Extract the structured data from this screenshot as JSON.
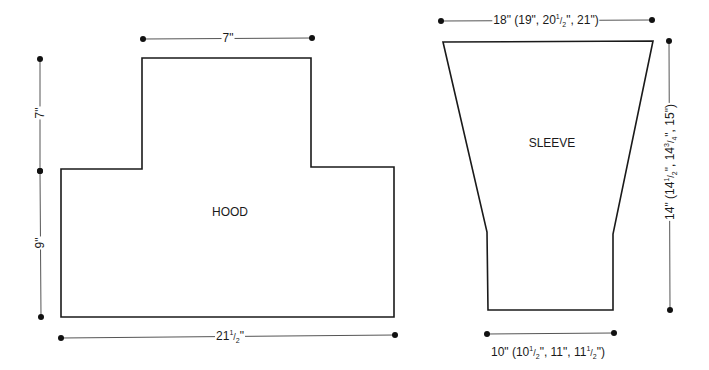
{
  "colors": {
    "background": "#ffffff",
    "outline": "#1a1a1a",
    "dimension_line": "#555555",
    "dot": "#111111",
    "text": "#1a1a1a"
  },
  "hood": {
    "label": "HOOD",
    "label_pos": [
      230,
      212
    ],
    "outline_points": [
      [
        142,
        58
      ],
      [
        311,
        58
      ],
      [
        311,
        167
      ],
      [
        394,
        167
      ],
      [
        394,
        317
      ],
      [
        61,
        317
      ],
      [
        61,
        169
      ],
      [
        142,
        169
      ]
    ],
    "dims": {
      "top_width": {
        "text_main": "7\"",
        "from": [
          143,
          39
        ],
        "to": [
          312,
          38
        ],
        "label_pos": [
          228,
          38
        ],
        "orientation": "horizontal"
      },
      "upper_height": {
        "text_main": "7\"",
        "from": [
          40,
          59
        ],
        "to": [
          40,
          171
        ],
        "label_pos": [
          40,
          113
        ],
        "orientation": "vertical"
      },
      "lower_height": {
        "text_main": "9\"",
        "from": [
          40,
          171
        ],
        "to": [
          41,
          317
        ],
        "label_pos": [
          40,
          243
        ],
        "orientation": "vertical"
      },
      "bottom_width": {
        "text_whole": "21",
        "frac_num": "1",
        "frac_den": "2",
        "text_suffix": "\"",
        "from": [
          61,
          338
        ],
        "to": [
          395,
          335
        ],
        "label_pos": [
          230,
          336
        ],
        "orientation": "horizontal"
      }
    }
  },
  "sleeve": {
    "label": "SLEEVE",
    "label_pos": [
      552,
      143
    ],
    "outline_points": [
      [
        443,
        42
      ],
      [
        653,
        41
      ],
      [
        613,
        234
      ],
      [
        613,
        310
      ],
      [
        488,
        310
      ],
      [
        487,
        232
      ]
    ],
    "dims": {
      "top_width": {
        "text": "18\" (19\", 20½\", 21\")",
        "parts": [
          "18\" (19\", 20",
          "1",
          "2",
          "\", 21\")"
        ],
        "from": [
          441,
          21
        ],
        "to": [
          652,
          20
        ],
        "label_pos": [
          546,
          20
        ],
        "orientation": "horizontal"
      },
      "length": {
        "text": "14\" (14½\", 14¾\", 15\")",
        "parts": [
          "14\" (14",
          "1",
          "2",
          "\", 14",
          "3",
          "4",
          "\", 15\")"
        ],
        "from": [
          669,
          41
        ],
        "to": [
          670,
          310
        ],
        "label_pos": [
          670,
          162
        ],
        "orientation": "vertical"
      },
      "cuff_width": {
        "text": "10\" (10½\", 11\", 11½\")",
        "parts": [
          "10\" (10",
          "1",
          "2",
          "\", 11\", 11",
          "1",
          "2",
          "\")"
        ],
        "from": [
          487,
          334
        ],
        "to": [
          614,
          333
        ],
        "label_pos": [
          548,
          352
        ],
        "orientation": "horizontal"
      }
    }
  }
}
